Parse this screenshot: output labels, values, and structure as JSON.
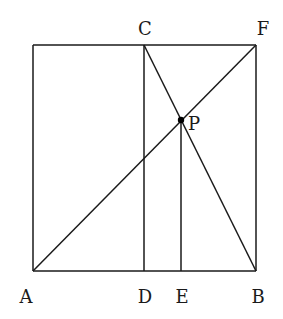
{
  "diagram": {
    "type": "geometry",
    "stroke_color": "#1a1a1a",
    "points": {
      "A": {
        "x": 33,
        "y": 271,
        "label": "A",
        "lx": 26,
        "ly": 303
      },
      "B": {
        "x": 256,
        "y": 271,
        "label": "B",
        "lx": 258,
        "ly": 303
      },
      "C": {
        "x": 144,
        "y": 45,
        "label": "C",
        "lx": 145,
        "ly": 35
      },
      "D": {
        "x": 144,
        "y": 271,
        "label": "D",
        "lx": 145,
        "ly": 303
      },
      "E": {
        "x": 181,
        "y": 271,
        "label": "E",
        "lx": 182,
        "ly": 303
      },
      "F": {
        "x": 256,
        "y": 45,
        "label": "F",
        "lx": 263,
        "ly": 35
      },
      "G": {
        "x": 33,
        "y": 45,
        "label": ""
      },
      "P": {
        "x": 181,
        "y": 120,
        "label": "P",
        "lx": 194,
        "ly": 130
      }
    },
    "segments": [
      [
        "A",
        "B"
      ],
      [
        "A",
        "G"
      ],
      [
        "G",
        "F"
      ],
      [
        "F",
        "B"
      ],
      [
        "C",
        "D"
      ],
      [
        "A",
        "F"
      ],
      [
        "C",
        "B"
      ],
      [
        "P",
        "E"
      ]
    ],
    "marked_points": [
      "P"
    ]
  }
}
